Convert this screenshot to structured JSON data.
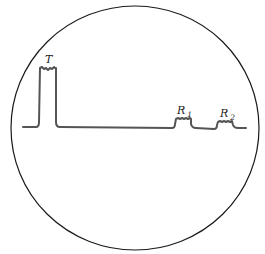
{
  "diagram": {
    "type": "oscilloscope-trace",
    "screen": {
      "shape": "circle",
      "stroke": "#1a1a1a"
    },
    "trace": {
      "color": "#555555"
    },
    "labels": {
      "transmit": {
        "main": "T",
        "sub": ""
      },
      "echo1": {
        "main": "R",
        "sub": "1"
      },
      "echo2": {
        "main": "R",
        "sub": "2"
      }
    }
  }
}
